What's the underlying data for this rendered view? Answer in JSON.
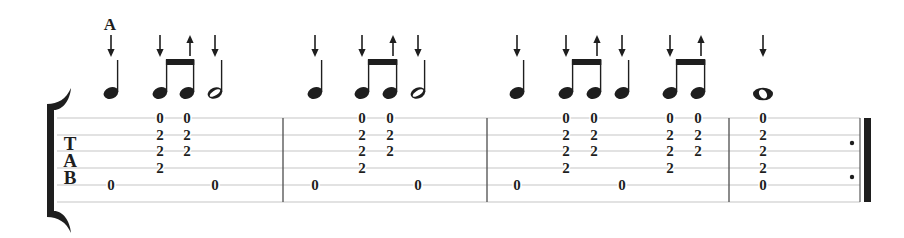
{
  "chord_symbol": "A",
  "tab_clef": {
    "t": "T",
    "a": "A",
    "b": "B"
  },
  "colors": {
    "ink": "#1e1e1e",
    "staff_line": "#c6c6c6",
    "barline": "#5a5a5a",
    "background": "#ffffff"
  },
  "staff": {
    "strings": 6,
    "line_y": [
      118,
      135,
      151,
      168,
      185,
      202
    ],
    "x_start": 57,
    "x_end": 860
  },
  "barlines_x": [
    283,
    487,
    729
  ],
  "final_barline": {
    "thin_x": 860,
    "thick_x": 864,
    "thick_width": 7,
    "repeat_dots": {
      "x": 852,
      "y": [
        143,
        177
      ]
    }
  },
  "measures": [
    {
      "number": 1,
      "events": [
        {
          "x": 111,
          "duration": "quarter",
          "strum": "down",
          "tab": [
            null,
            null,
            null,
            null,
            "0",
            null
          ]
        },
        {
          "x": 160,
          "duration": "eighth",
          "strum": "down",
          "beam": 1,
          "tab": [
            "0",
            "2",
            "2",
            "2",
            null,
            null
          ]
        },
        {
          "x": 187,
          "duration": "eighth",
          "strum": "up",
          "beam": 1,
          "tab": [
            "0",
            "2",
            "2",
            null,
            null,
            null
          ]
        },
        {
          "x": 215,
          "duration": "half",
          "strum": "down",
          "tab": [
            null,
            null,
            null,
            null,
            "0",
            null
          ]
        }
      ]
    },
    {
      "number": 2,
      "events": [
        {
          "x": 315,
          "duration": "quarter",
          "strum": "down",
          "tab": [
            null,
            null,
            null,
            null,
            "0",
            null
          ]
        },
        {
          "x": 362,
          "duration": "eighth",
          "strum": "down",
          "beam": 1,
          "tab": [
            "0",
            "2",
            "2",
            "2",
            null,
            null
          ]
        },
        {
          "x": 390,
          "duration": "eighth",
          "strum": "up",
          "beam": 1,
          "tab": [
            "0",
            "2",
            "2",
            null,
            null,
            null
          ]
        },
        {
          "x": 418,
          "duration": "half",
          "strum": "down",
          "tab": [
            null,
            null,
            null,
            null,
            "0",
            null
          ]
        }
      ]
    },
    {
      "number": 3,
      "events": [
        {
          "x": 517,
          "duration": "quarter",
          "strum": "down",
          "tab": [
            null,
            null,
            null,
            null,
            "0",
            null
          ]
        },
        {
          "x": 566,
          "duration": "eighth",
          "strum": "down",
          "beam": 1,
          "tab": [
            "0",
            "2",
            "2",
            "2",
            null,
            null
          ]
        },
        {
          "x": 594,
          "duration": "eighth",
          "strum": "up",
          "beam": 1,
          "tab": [
            "0",
            "2",
            "2",
            null,
            null,
            null
          ]
        },
        {
          "x": 622,
          "duration": "quarter",
          "strum": "down",
          "tab": [
            null,
            null,
            null,
            null,
            "0",
            null
          ]
        },
        {
          "x": 670,
          "duration": "eighth",
          "strum": "down",
          "beam": 2,
          "tab": [
            "0",
            "2",
            "2",
            "2",
            null,
            null
          ]
        },
        {
          "x": 698,
          "duration": "eighth",
          "strum": "up",
          "beam": 2,
          "tab": [
            "0",
            "2",
            "2",
            null,
            null,
            null
          ]
        }
      ]
    },
    {
      "number": 4,
      "events": [
        {
          "x": 763,
          "duration": "whole",
          "strum": "down",
          "tab": [
            "0",
            "2",
            "2",
            "2",
            "0",
            null
          ]
        }
      ]
    }
  ]
}
